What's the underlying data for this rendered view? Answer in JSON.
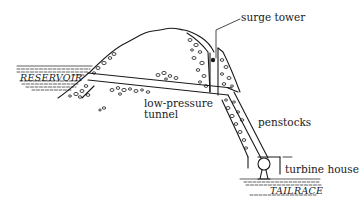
{
  "diagram": {
    "colors": {
      "ink": "#1a1a1a",
      "background": "#ffffff"
    },
    "labels": {
      "reservoir": "RESERVOIR",
      "surge_tower": "surge tower",
      "low_pressure_tunnel_line1": "low-pressure",
      "low_pressure_tunnel_line2": "tunnel",
      "penstocks": "penstocks",
      "turbine_house": "turbine house",
      "tailrace": "TAILRACE"
    }
  }
}
